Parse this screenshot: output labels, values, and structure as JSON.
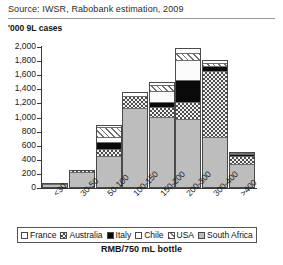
{
  "source": "Source: IWSR, Rabobank estimation, 2009",
  "unit_label": "'000 9L cases",
  "xaxis_title": "RMB/750 mL bottle",
  "legend": {
    "items": [
      {
        "label": "France",
        "key": "france",
        "color": "#ffffff"
      },
      {
        "label": "Australia",
        "key": "australia",
        "color": "#4d4d4d"
      },
      {
        "label": "Italy",
        "key": "italy",
        "color": "#0a0a0a"
      },
      {
        "label": "Chile",
        "key": "chile",
        "color": "#fbfbfb"
      },
      {
        "label": "USA",
        "key": "usa",
        "color": "#6f6f6f"
      },
      {
        "label": "South Africa",
        "key": "southafrica",
        "color": "#bdbdbd"
      }
    ]
  },
  "chart_data": {
    "type": "bar",
    "stacked": true,
    "title": "",
    "xlabel": "RMB/750 mL bottle",
    "ylabel": "'000 9L cases",
    "ylim": [
      0,
      2000
    ],
    "yticks": [
      0,
      200,
      400,
      600,
      800,
      1000,
      1200,
      1400,
      1600,
      1800,
      2000
    ],
    "ytick_labels": [
      "0",
      "200",
      "400",
      "600",
      "800",
      "1,000",
      "1,200",
      "1,400",
      "1,600",
      "1,800",
      "2,000"
    ],
    "grid": false,
    "legend_position": "bottom",
    "categories": [
      "<30",
      "30-50",
      "50-100",
      "100-150",
      "150-200",
      "200-300",
      "300-400",
      ">400"
    ],
    "series": [
      {
        "name": "South Africa",
        "values": [
          60,
          220,
          440,
          1130,
          1000,
          960,
          700,
          330
        ]
      },
      {
        "name": "Australia",
        "values": [
          10,
          30,
          110,
          180,
          140,
          250,
          960,
          130
        ]
      },
      {
        "name": "Italy",
        "values": [
          0,
          0,
          90,
          0,
          70,
          310,
          70,
          15
        ]
      },
      {
        "name": "Chile",
        "values": [
          0,
          0,
          80,
          0,
          160,
          290,
          0,
          0
        ]
      },
      {
        "name": "USA",
        "values": [
          0,
          0,
          140,
          0,
          90,
          110,
          50,
          15
        ]
      },
      {
        "name": "France",
        "values": [
          0,
          0,
          30,
          50,
          40,
          60,
          40,
          20
        ]
      }
    ],
    "totals": [
      70,
      250,
      890,
      1360,
      1500,
      1980,
      1820,
      510
    ]
  }
}
